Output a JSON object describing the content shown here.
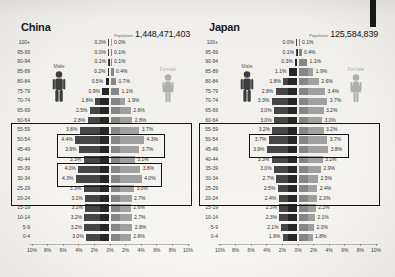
{
  "page": {
    "background": "#f2f0ec",
    "male_color": "#454545",
    "male_inner_color": "#262626",
    "female_color": "#a0a0a0",
    "female_inner_color": "#868686",
    "box_color": "#141414"
  },
  "chart_data": [
    {
      "type": "bar",
      "variant": "population_pyramid",
      "title": "China",
      "population_label": "Population",
      "population": "1,448,471,403",
      "male_label": "Male",
      "female_label": "Female",
      "xlabel": "",
      "ylabel": "Age group",
      "xlim_pct": 10,
      "x_ticks": [
        "10%",
        "8%",
        "6%",
        "4%",
        "2%",
        "0%",
        "2%",
        "4%",
        "6%",
        "8%",
        "10%"
      ],
      "categories": [
        "100+",
        "95-99",
        "90-94",
        "85-89",
        "80-84",
        "75-79",
        "70-74",
        "65-69",
        "60-64",
        "55-59",
        "50-54",
        "45-49",
        "40-44",
        "35-39",
        "30-34",
        "25-29",
        "20-24",
        "15-19",
        "10-14",
        "5-9",
        "0-4"
      ],
      "series": [
        {
          "name": "Male",
          "values": [
            0.0,
            0.0,
            0.1,
            0.2,
            0.5,
            0.9,
            1.8,
            2.5,
            2.8,
            3.8,
            4.4,
            3.9,
            3.3,
            4.0,
            4.3,
            3.3,
            3.1,
            3.1,
            3.2,
            3.2,
            3.0
          ]
        },
        {
          "name": "Female",
          "values": [
            0.0,
            0.1,
            0.1,
            0.4,
            0.7,
            1.1,
            1.9,
            2.6,
            2.8,
            3.7,
            4.3,
            3.7,
            3.1,
            3.8,
            4.0,
            3.0,
            2.7,
            2.6,
            2.7,
            2.8,
            2.6
          ]
        }
      ],
      "annotations": {
        "big_box_rows": [
          "55-59",
          "20-24"
        ],
        "pair_boxes_rows": [
          [
            "50-54",
            "45-49"
          ],
          [
            "35-39",
            "30-34"
          ]
        ]
      },
      "colors": {
        "male": "#454545",
        "male_inner": "#262626",
        "female": "#a0a0a0",
        "female_inner": "#868686"
      }
    },
    {
      "type": "bar",
      "variant": "population_pyramid",
      "title": "Japan",
      "population_label": "Population",
      "population": "125,584,839",
      "male_label": "Male",
      "female_label": "Female",
      "xlabel": "",
      "ylabel": "Age group",
      "xlim_pct": 10,
      "x_ticks": [
        "10%",
        "8%",
        "6%",
        "4%",
        "2%",
        "0%",
        "2%",
        "4%",
        "6%",
        "8%",
        "10%"
      ],
      "categories": [
        "100+",
        "95-99",
        "90-94",
        "85-89",
        "80-84",
        "75-79",
        "70-74",
        "65-69",
        "60-64",
        "55-59",
        "50-54",
        "45-49",
        "40-44",
        "35-39",
        "30-34",
        "25-29",
        "20-24",
        "15-19",
        "10-14",
        "5-9",
        "0-4"
      ],
      "series": [
        {
          "name": "Male",
          "values": [
            0.0,
            0.1,
            0.3,
            1.1,
            1.8,
            2.8,
            3.3,
            3.0,
            3.0,
            3.2,
            3.7,
            3.9,
            3.3,
            3.0,
            2.7,
            2.5,
            2.4,
            2.3,
            2.3,
            2.1,
            1.9
          ]
        },
        {
          "name": "Female",
          "values": [
            0.1,
            0.4,
            1.1,
            1.9,
            2.6,
            3.4,
            3.7,
            3.2,
            3.0,
            3.2,
            3.7,
            3.8,
            3.1,
            2.9,
            2.5,
            2.4,
            2.3,
            2.2,
            2.1,
            2.0,
            1.8
          ]
        }
      ],
      "annotations": {
        "big_box_rows": [
          "55-59",
          "20-24"
        ],
        "pair_boxes_rows": [
          [
            "50-54",
            "45-49"
          ]
        ]
      },
      "colors": {
        "male": "#454545",
        "male_inner": "#262626",
        "female": "#a0a0a0",
        "female_inner": "#868686"
      }
    }
  ]
}
